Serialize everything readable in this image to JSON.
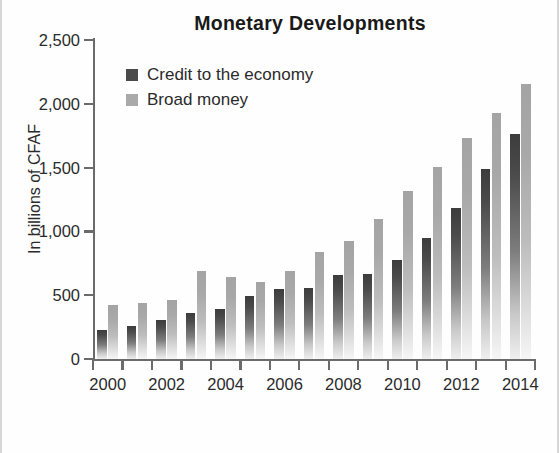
{
  "chart_data": {
    "type": "bar",
    "title": "Monetary Developments",
    "xlabel": "",
    "ylabel": "In billions of CFAF",
    "ylim": [
      0,
      2500
    ],
    "yticks": [
      0,
      500,
      1000,
      1500,
      2000,
      2500
    ],
    "ytick_labels": [
      "0",
      "500",
      "1,000",
      "1,500",
      "2,000",
      "2,500"
    ],
    "grid": false,
    "legend_position": "upper-left-inside",
    "categories": [
      2000,
      2001,
      2002,
      2003,
      2004,
      2005,
      2006,
      2007,
      2008,
      2009,
      2010,
      2011,
      2012,
      2013,
      2014
    ],
    "xtick_labels": [
      "2000",
      "",
      "2002",
      "",
      "2004",
      "",
      "2006",
      "",
      "2008",
      "",
      "2010",
      "",
      "2012",
      "",
      "2014"
    ],
    "series": [
      {
        "name": "Credit to the economy",
        "color": "#4a4a4a",
        "values": [
          230,
          255,
          305,
          360,
          390,
          490,
          545,
          555,
          655,
          670,
          775,
          950,
          1185,
          1490,
          1765
        ]
      },
      {
        "name": "Broad money",
        "color": "#a9a9a9",
        "values": [
          420,
          440,
          460,
          690,
          640,
          600,
          690,
          840,
          925,
          1100,
          1320,
          1505,
          1730,
          1930,
          2155
        ]
      }
    ]
  },
  "legend": {
    "items": [
      {
        "label": "Credit to the economy",
        "swatch": "credit"
      },
      {
        "label": "Broad money",
        "swatch": "broad"
      }
    ]
  }
}
